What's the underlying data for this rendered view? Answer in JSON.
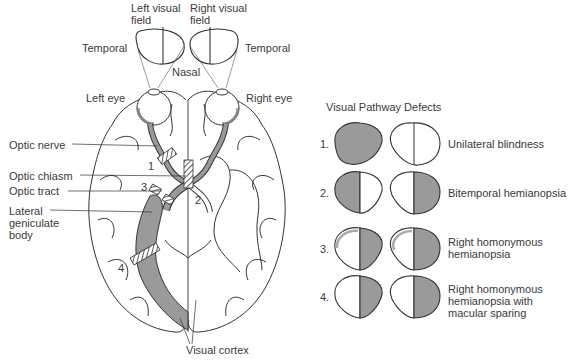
{
  "colors": {
    "fill": "#9a9a9a",
    "line": "#333333",
    "background": "#ffffff"
  },
  "brain_diagram": {
    "visual_fields": [
      {
        "label": "Left visual\nfield"
      },
      {
        "label": "Right visual\nfield"
      }
    ],
    "labels": {
      "temporal_left": "Temporal",
      "temporal_right": "Temporal",
      "nasal": "Nasal",
      "left_eye": "Left eye",
      "right_eye": "Right eye",
      "optic_nerve": "Optic nerve",
      "optic_chiasm": "Optic chiasm",
      "optic_tract": "Optic tract",
      "lateral_geniculate_body": "Lateral\ngeniculate\nbody",
      "visual_cortex": "Visual cortex"
    },
    "lesion_markers": [
      "1",
      "2",
      "3",
      "4"
    ]
  },
  "defects_panel": {
    "title": "Visual Pathway Defects",
    "rows": [
      {
        "number": "1.",
        "label": "Unilateral blindness"
      },
      {
        "number": "2.",
        "label": "Bitemporal hemianopsia"
      },
      {
        "number": "3.",
        "label": "Right homonymous\nhemianopsia"
      },
      {
        "number": "4.",
        "label": "Right homonymous\nhemianopsia with\nmacular sparing"
      }
    ]
  }
}
